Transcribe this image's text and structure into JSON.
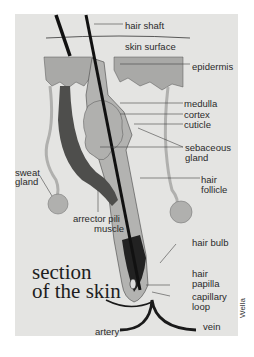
{
  "figure": {
    "title_line1": "section",
    "title_line2": "of the skin",
    "credit": "Wella",
    "colors": {
      "panel": "#e4e4e2",
      "epidermis": "#a9a9a7",
      "follicle": "#b3b3b1",
      "muscle": "#4e4e4c",
      "hair": "#111111",
      "gland": "#b0b0ae",
      "vessels": "#1a1a1a"
    },
    "labels": {
      "hair_shaft": "hair shaft",
      "skin_surface": "skin surface",
      "epidermis": "epidermis",
      "medulla": "medulla",
      "cortex": "cortex",
      "cuticle": "cuticle",
      "sebaceous_1": "sebaceous",
      "sebaceous_2": "gland",
      "sweat_1": "sweat",
      "sweat_2": "gland",
      "follicle_1": "hair",
      "follicle_2": "follicle",
      "arrector_1": "arrector pili",
      "arrector_2": "muscle",
      "hair_bulb": "hair bulb",
      "papilla_1": "hair",
      "papilla_2": "papilla",
      "capillary_1": "capillary",
      "capillary_2": "loop",
      "artery": "artery",
      "vein": "vein"
    }
  }
}
